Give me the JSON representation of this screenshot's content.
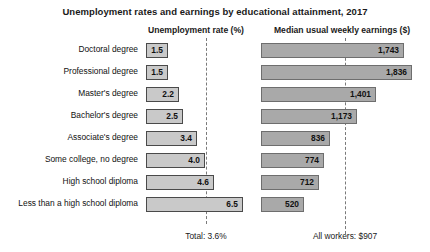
{
  "chart_data": {
    "type": "bar",
    "title": "Unemployment rates and earnings by educational attainment, 2017",
    "orientation": "horizontal",
    "panels": [
      {
        "key": "unemployment",
        "header": "Unemployment rate (%)",
        "xlabel": "",
        "ylabel": "",
        "xlim": [
          0,
          7
        ],
        "grid": false,
        "bar_color": "#c9c9c9",
        "reference": {
          "label": "Total: 3.6%",
          "value": 3.6,
          "style": "dashed"
        }
      },
      {
        "key": "earnings",
        "header": "Median usual weekly earnings ($)",
        "xlabel": "",
        "ylabel": "",
        "xlim": [
          0,
          2000
        ],
        "grid": false,
        "bar_color": "#a9a9a9",
        "reference": {
          "label": "All workers: $907",
          "value": 907,
          "style": "dashed"
        }
      }
    ],
    "categories": [
      "Doctoral degree",
      "Professional degree",
      "Master's degree",
      "Bachelor's degree",
      "Associate's degree",
      "Some college, no degree",
      "High school diploma",
      "Less than a high school diploma"
    ],
    "series": [
      {
        "name": "Unemployment rate (%)",
        "panel": "unemployment",
        "values": [
          1.5,
          1.5,
          2.2,
          2.5,
          3.4,
          4.0,
          4.6,
          6.5
        ],
        "labels": [
          "1.5",
          "1.5",
          "2.2",
          "2.5",
          "3.4",
          "4.0",
          "4.6",
          "6.5"
        ]
      },
      {
        "name": "Median usual weekly earnings ($)",
        "panel": "earnings",
        "values": [
          1743,
          1836,
          1401,
          1173,
          836,
          774,
          712,
          520
        ],
        "labels": [
          "1,743",
          "1,836",
          "1,401",
          "1,173",
          "836",
          "774",
          "712",
          "520"
        ]
      }
    ]
  },
  "header": {
    "title": "Unemployment rates and earnings by educational attainment, 2017",
    "col_rate": "Unemployment rate (%)",
    "col_earnings": "Median usual weekly earnings ($)"
  },
  "rows": [
    {
      "category": "Doctoral degree",
      "rate": "1.5",
      "earnings": "1,743"
    },
    {
      "category": "Professional degree",
      "rate": "1.5",
      "earnings": "1,836"
    },
    {
      "category": "Master's degree",
      "rate": "2.2",
      "earnings": "1,401"
    },
    {
      "category": "Bachelor's degree",
      "rate": "2.5",
      "earnings": "1,173"
    },
    {
      "category": "Associate's degree",
      "rate": "3.4",
      "earnings": "836"
    },
    {
      "category": "Some college, no degree",
      "rate": "4.0",
      "earnings": "774"
    },
    {
      "category": "High school diploma",
      "rate": "4.6",
      "earnings": "712"
    },
    {
      "category": "Less than a high school diploma",
      "rate": "6.5",
      "earnings": "520"
    }
  ],
  "footnotes": {
    "rate_total": "Total: 3.6%",
    "earnings_total": "All workers: $907"
  },
  "colors": {
    "rate_bar": "#c9c9c9",
    "rate_bar_border": "#4a4a4a",
    "earnings_bar": "#a9a9a9",
    "earnings_bar_border": "#6e6e6e",
    "refline": "#7a7a7a",
    "text": "#111111",
    "background": "#ffffff"
  }
}
